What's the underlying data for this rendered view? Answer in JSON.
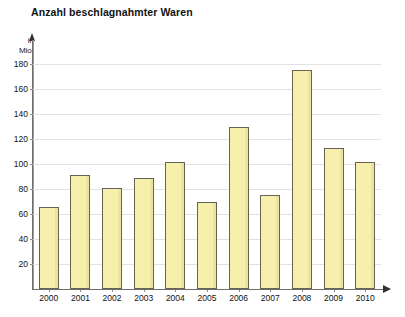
{
  "chart_data": {
    "type": "bar",
    "title": "Anzahl beschlagnahmter Waren",
    "xlabel": "",
    "ylabel": "in Mio.",
    "categories": [
      "2000",
      "2001",
      "2002",
      "2003",
      "2004",
      "2005",
      "2006",
      "2007",
      "2008",
      "2009",
      "2010"
    ],
    "values": [
      66,
      91,
      81,
      89,
      102,
      70,
      130,
      75,
      175,
      113,
      102
    ],
    "ylim": [
      0,
      190
    ],
    "yticks": [
      20,
      40,
      60,
      80,
      100,
      120,
      140,
      160,
      180
    ],
    "grid": true,
    "legend": "none",
    "bar_color": "#F7F0AD",
    "bar_border_color": "#6A6250",
    "gridline_color": "#E2E2E2",
    "axis_color": "#6E6E6E",
    "background": "#FFFFFF"
  },
  "axis_unit_lines": [
    "in",
    "Mio."
  ]
}
